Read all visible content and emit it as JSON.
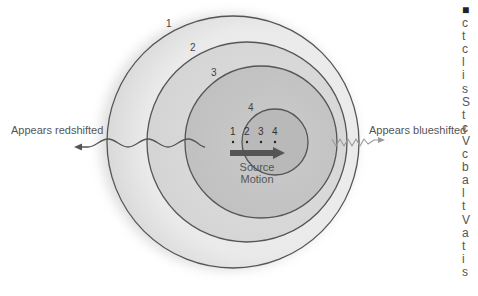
{
  "figure": {
    "wavefront_labels": [
      "1",
      "2",
      "3",
      "4"
    ],
    "source_position_labels": [
      "1",
      "2",
      "3",
      "4"
    ],
    "source_motion_label_line1": "Source",
    "source_motion_label_line2": "Motion",
    "left_label": "Appears redshifted",
    "right_label": "Appears blueshifted"
  },
  "colors": {
    "outline": "#555555",
    "ring1_fill": "#ebebeb",
    "ring2_fill": "#dadada",
    "ring3_fill": "#c8c8c8",
    "ring4_fill": "#b8b8b8",
    "arrow": "#555555",
    "redshift_wave": "#555555",
    "blueshift_wave": "#9a9a9a"
  },
  "clipped_caption_glyphs": [
    "■",
    "c",
    "t",
    "c",
    "l",
    "i",
    "s",
    "S",
    "t",
    "c",
    "V",
    "c",
    "b",
    "a",
    "l",
    "t",
    "V",
    "a",
    "t",
    "i",
    "s"
  ]
}
